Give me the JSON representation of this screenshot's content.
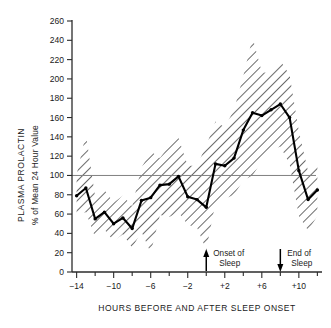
{
  "chart_data": {
    "type": "line",
    "title": "",
    "xlabel": "HOURS BEFORE AND AFTER SLEEP ONSET",
    "ylabel_line1": "PLASMA PROLACTIN",
    "ylabel_line2": "% of Mean 24 Hour Value",
    "xlim": [
      -14.5,
      12.5
    ],
    "ylim": [
      0,
      260
    ],
    "ytick_step": 20,
    "yticks": [
      0,
      20,
      40,
      60,
      80,
      100,
      120,
      140,
      160,
      180,
      200,
      220,
      240,
      260
    ],
    "ytick_labels": [
      "0",
      "20",
      "40",
      "60",
      "80",
      "100",
      "120",
      "140",
      "160",
      "180",
      "200",
      "220",
      "240",
      "260"
    ],
    "xticks": [
      -14,
      -12,
      -10,
      -8,
      -6,
      -4,
      -2,
      0,
      2,
      4,
      6,
      8,
      10,
      12
    ],
    "xtick_major": [
      -14,
      -10,
      -6,
      -2,
      2,
      6,
      10
    ],
    "xtick_labels": [
      "−14",
      "−10",
      "−6",
      "−2",
      "+2",
      "+6",
      "+10"
    ],
    "grid": false,
    "legend": "none",
    "reference_line": {
      "value": 100,
      "label": "100% of mean 24 hour value",
      "color": "#808080"
    },
    "x": [
      -14,
      -13,
      -12,
      -11,
      -10,
      -9,
      -8,
      -7,
      -6,
      -5,
      -4,
      -3,
      -2,
      -1,
      0,
      1,
      2,
      3,
      4,
      5,
      6,
      7,
      8,
      9,
      10,
      11,
      12
    ],
    "series": [
      {
        "name": "Mean plasma prolactin",
        "style": "solid-line-with-markers",
        "color": "#000000",
        "values": [
          79,
          87,
          55,
          62,
          50,
          56,
          45,
          74,
          77,
          90,
          91,
          99,
          78,
          75,
          67,
          112,
          110,
          118,
          147,
          165,
          162,
          168,
          174,
          160,
          105,
          75,
          85
        ]
      },
      {
        "name": "Upper bound (hatched band, ± SEM)",
        "style": "hatched-band-edge",
        "color": "#000000",
        "values": [
          101,
          143,
          78,
          85,
          72,
          79,
          68,
          108,
          125,
          118,
          131,
          139,
          110,
          110,
          131,
          156,
          150,
          168,
          203,
          243,
          207,
          206,
          219,
          204,
          146,
          104,
          112
        ]
      },
      {
        "name": "Lower bound (hatched band, ± SEM)",
        "style": "hatched-band-edge",
        "color": "#000000",
        "values": [
          60,
          62,
          36,
          44,
          32,
          39,
          25,
          42,
          20,
          59,
          57,
          62,
          49,
          46,
          23,
          72,
          76,
          80,
          95,
          100,
          115,
          126,
          130,
          112,
          58,
          43,
          58
        ]
      }
    ],
    "annotations": [
      {
        "name": "sleep-onset",
        "text_line1": "Onset of",
        "text_line2": "Sleep",
        "x": 0,
        "arrow": "up"
      },
      {
        "name": "sleep-end",
        "text_line1": "End of",
        "text_line2": "Sleep",
        "x": 8,
        "arrow": "down"
      }
    ]
  }
}
